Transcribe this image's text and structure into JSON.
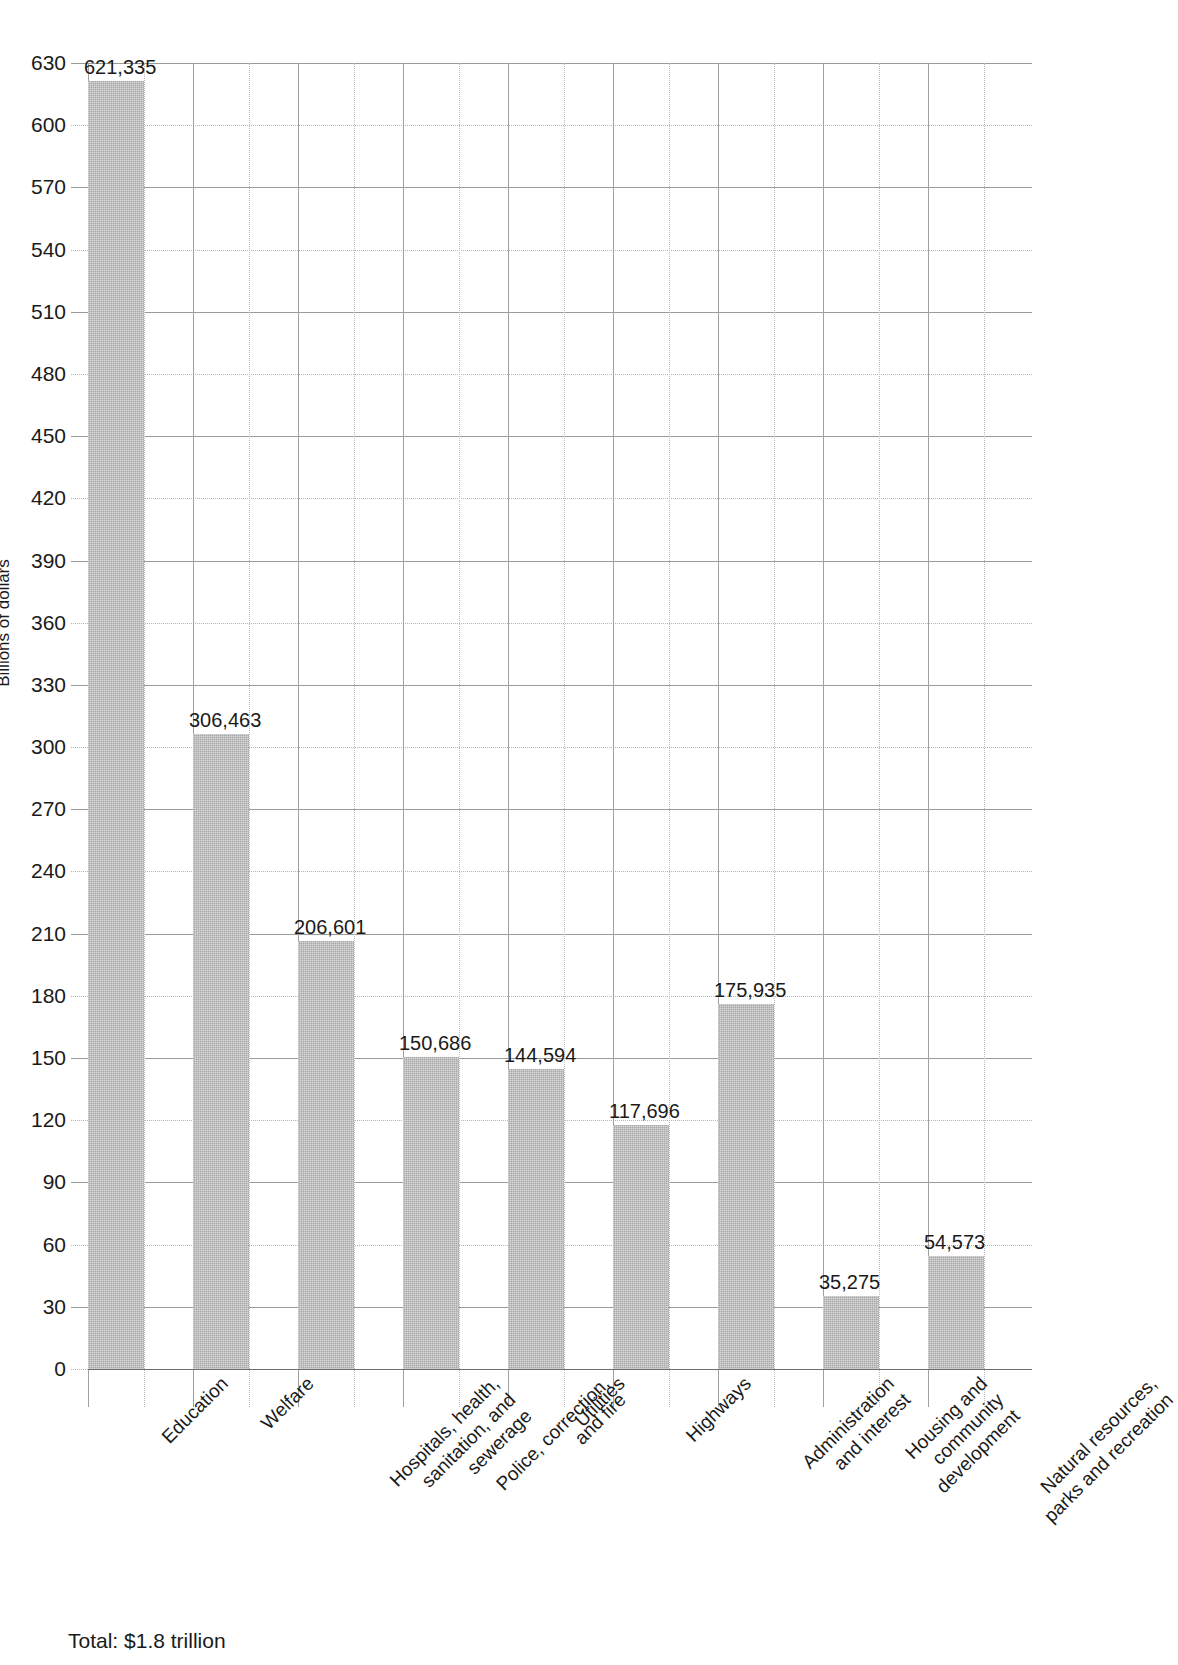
{
  "chart_data": {
    "type": "bar",
    "title": "",
    "subtitle": "",
    "xlabel": "",
    "ylabel": "Billions of dollars",
    "ylim": [
      0,
      630
    ],
    "ytick_step": 30,
    "yticks": [
      630,
      600,
      570,
      540,
      510,
      480,
      450,
      420,
      390,
      360,
      330,
      300,
      270,
      240,
      210,
      180,
      150,
      120,
      90,
      60,
      30,
      0
    ],
    "grid": true,
    "legend": "none",
    "value_units": "millions of dollars",
    "axis_units": "billions of dollars",
    "categories": [
      "Education",
      "Welfare",
      "Hospitals, health,\nsanitation, and\nsewerage",
      "Police, correction,\nand fire",
      "Utilities",
      "Highways",
      "Administration\nand interest",
      "Housing and\ncommunity\ndevelopment",
      "Natural resources,\nparks and recreation"
    ],
    "values": [
      621.335,
      306.463,
      206.601,
      150.686,
      144.594,
      117.696,
      175.935,
      35.275,
      54.573
    ],
    "value_labels": [
      "621,335",
      "306,463",
      "206,601",
      "150,686",
      "144,594",
      "117,696",
      "175,935",
      "35,275",
      "54,573"
    ],
    "bar_color": "#a8a8a8",
    "footnote": "Total: $1.8 trillion"
  },
  "footer": {
    "total_label": "Total: $1.8 trillion"
  }
}
